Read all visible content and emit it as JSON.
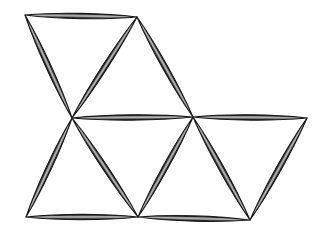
{
  "figure": {
    "background_color": "#ffffff",
    "stroke_color": "#1a1a1a",
    "fill_color": "#7d7d7d",
    "highlight_color": "#b4b4b4",
    "canvas": {
      "width": 329,
      "height": 232
    },
    "vertices": [
      {
        "id": "A",
        "name": "top-left-vertex",
        "x": 25,
        "y": 15,
        "degree": 2
      },
      {
        "id": "B",
        "name": "top-right-vertex",
        "x": 137,
        "y": 17,
        "degree": 3
      },
      {
        "id": "C",
        "name": "center-left-vertex",
        "x": 72,
        "y": 118,
        "degree": 5
      },
      {
        "id": "D",
        "name": "center-right-vertex",
        "x": 193,
        "y": 117,
        "degree": 5
      },
      {
        "id": "E",
        "name": "middle-right-vertex",
        "x": 307,
        "y": 118,
        "degree": 2
      },
      {
        "id": "F",
        "name": "bottom-left-vertex",
        "x": 26,
        "y": 217,
        "degree": 2
      },
      {
        "id": "G",
        "name": "bottom-center-vertex",
        "x": 138,
        "y": 217,
        "degree": 4
      },
      {
        "id": "H",
        "name": "bottom-right-vertex",
        "x": 250,
        "y": 220,
        "degree": 3
      }
    ],
    "struts": [
      {
        "id": "AB",
        "name": "strut-top-horizontal",
        "from": "A",
        "to": "B",
        "thickness": 7.0
      },
      {
        "id": "AC",
        "name": "strut-upper-left-diagonal",
        "from": "A",
        "to": "C",
        "thickness": 7.0
      },
      {
        "id": "BC",
        "name": "strut-upper-middle-diagonal",
        "from": "B",
        "to": "C",
        "thickness": 7.0
      },
      {
        "id": "BD",
        "name": "strut-upper-right-diagonal",
        "from": "B",
        "to": "D",
        "thickness": 7.0
      },
      {
        "id": "CD",
        "name": "strut-middle-left-horizontal",
        "from": "C",
        "to": "D",
        "thickness": 7.0
      },
      {
        "id": "DE",
        "name": "strut-middle-right-horizontal",
        "from": "D",
        "to": "E",
        "thickness": 7.0
      },
      {
        "id": "CF",
        "name": "strut-lower-left-diagonal",
        "from": "C",
        "to": "F",
        "thickness": 7.0
      },
      {
        "id": "CG",
        "name": "strut-lower-middle-left-diagonal",
        "from": "C",
        "to": "G",
        "thickness": 7.0
      },
      {
        "id": "DG",
        "name": "strut-lower-middle-right-diagonal",
        "from": "D",
        "to": "G",
        "thickness": 7.0
      },
      {
        "id": "DH",
        "name": "strut-lower-right-inner-diagonal",
        "from": "D",
        "to": "H",
        "thickness": 7.0
      },
      {
        "id": "EH",
        "name": "strut-lower-right-outer-diagonal",
        "from": "E",
        "to": "H",
        "thickness": 7.0
      },
      {
        "id": "FG",
        "name": "strut-bottom-left-horizontal",
        "from": "F",
        "to": "G",
        "thickness": 7.0
      },
      {
        "id": "GH",
        "name": "strut-bottom-right-horizontal",
        "from": "G",
        "to": "H",
        "thickness": 7.0
      }
    ],
    "triangles": [
      {
        "id": "T1",
        "name": "triangle-upper-left",
        "vertices": [
          "A",
          "B",
          "C"
        ],
        "orientation": "point-down"
      },
      {
        "id": "T2",
        "name": "triangle-upper-right",
        "vertices": [
          "B",
          "C",
          "D"
        ],
        "orientation": "point-up"
      },
      {
        "id": "T3",
        "name": "triangle-lower-left",
        "vertices": [
          "C",
          "F",
          "G"
        ],
        "orientation": "point-up"
      },
      {
        "id": "T4",
        "name": "triangle-lower-middle",
        "vertices": [
          "C",
          "D",
          "G"
        ],
        "orientation": "point-down"
      },
      {
        "id": "T5",
        "name": "triangle-lower-right",
        "vertices": [
          "D",
          "E",
          "H"
        ],
        "orientation": "point-down"
      },
      {
        "id": "T6",
        "name": "triangle-bottom-middle",
        "vertices": [
          "D",
          "G",
          "H"
        ],
        "orientation": "point-up"
      }
    ],
    "counts": {
      "struts": 13,
      "vertices": 8,
      "triangles": 6
    }
  }
}
